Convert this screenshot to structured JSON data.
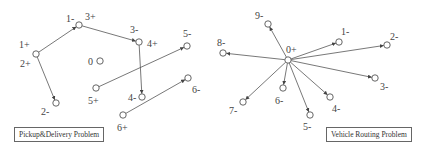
{
  "panels": [
    {
      "id": "pdp",
      "caption": "Pickup&Delivery Problem",
      "nodes": [
        {
          "id": "n1p",
          "x": 36,
          "y": 54,
          "labels": [
            {
              "text": "1+",
              "x": 19,
              "y": 48
            },
            {
              "text": "2+",
              "x": 20,
              "y": 67
            }
          ]
        },
        {
          "id": "n1m",
          "x": 79,
          "y": 25,
          "labels": [
            {
              "text": "1-",
              "x": 66,
              "y": 22
            },
            {
              "text": "3+",
              "x": 85,
              "y": 20
            }
          ]
        },
        {
          "id": "n3m",
          "x": 139,
          "y": 42,
          "labels": [
            {
              "text": "3-",
              "x": 130,
              "y": 33
            },
            {
              "text": "4+",
              "x": 147,
              "y": 47
            }
          ]
        },
        {
          "id": "n2m",
          "x": 56,
          "y": 103,
          "labels": [
            {
              "text": "2-",
              "x": 41,
              "y": 115
            }
          ]
        },
        {
          "id": "n0",
          "x": 100,
          "y": 61,
          "labels": [
            {
              "text": "0",
              "x": 88,
              "y": 65
            }
          ]
        },
        {
          "id": "n5p",
          "x": 96,
          "y": 88,
          "labels": [
            {
              "text": "5+",
              "x": 88,
              "y": 104
            }
          ]
        },
        {
          "id": "n5m",
          "x": 187,
          "y": 46,
          "labels": [
            {
              "text": "5-",
              "x": 183,
              "y": 37
            }
          ]
        },
        {
          "id": "n4m",
          "x": 142,
          "y": 97,
          "labels": [
            {
              "text": "4-",
              "x": 128,
              "y": 101
            }
          ]
        },
        {
          "id": "n6p",
          "x": 123,
          "y": 115,
          "labels": [
            {
              "text": "6+",
              "x": 117,
              "y": 131
            }
          ]
        },
        {
          "id": "n6m",
          "x": 188,
          "y": 78,
          "labels": [
            {
              "text": "6-",
              "x": 192,
              "y": 93
            }
          ]
        }
      ],
      "edges": [
        {
          "from": "n1p",
          "to": "n1m"
        },
        {
          "from": "n1m",
          "to": "n3m"
        },
        {
          "from": "n1p",
          "to": "n2m"
        },
        {
          "from": "n3m",
          "to": "n4m"
        },
        {
          "from": "n5p",
          "to": "n5m"
        },
        {
          "from": "n6p",
          "to": "n6m"
        }
      ]
    },
    {
      "id": "vrp",
      "caption": "Vehicle Routing Problem",
      "nodes": [
        {
          "id": "d0",
          "x": 288,
          "y": 60,
          "labels": [
            {
              "text": "0+",
              "x": 286,
              "y": 53
            }
          ]
        },
        {
          "id": "v1",
          "x": 339,
          "y": 42,
          "labels": [
            {
              "text": "1-",
              "x": 341,
              "y": 35
            }
          ]
        },
        {
          "id": "v2",
          "x": 387,
          "y": 45,
          "labels": [
            {
              "text": "2-",
              "x": 390,
              "y": 40
            }
          ]
        },
        {
          "id": "v3",
          "x": 375,
          "y": 78,
          "labels": [
            {
              "text": "3-",
              "x": 380,
              "y": 90
            }
          ]
        },
        {
          "id": "v4",
          "x": 330,
          "y": 97,
          "labels": [
            {
              "text": "4-",
              "x": 332,
              "y": 112
            }
          ]
        },
        {
          "id": "v5",
          "x": 310,
          "y": 115,
          "labels": [
            {
              "text": "5-",
              "x": 303,
              "y": 130
            }
          ]
        },
        {
          "id": "v6",
          "x": 283,
          "y": 88,
          "labels": [
            {
              "text": "6-",
              "x": 275,
              "y": 104
            }
          ]
        },
        {
          "id": "v7",
          "x": 243,
          "y": 102,
          "labels": [
            {
              "text": "7-",
              "x": 229,
              "y": 114
            }
          ]
        },
        {
          "id": "v8",
          "x": 223,
          "y": 53,
          "labels": [
            {
              "text": "8-",
              "x": 217,
              "y": 46
            }
          ]
        },
        {
          "id": "v9",
          "x": 268,
          "y": 24,
          "labels": [
            {
              "text": "9-",
              "x": 255,
              "y": 19
            }
          ]
        }
      ],
      "edges": [
        {
          "from": "d0",
          "to": "v1"
        },
        {
          "from": "d0",
          "to": "v2"
        },
        {
          "from": "d0",
          "to": "v3"
        },
        {
          "from": "d0",
          "to": "v4"
        },
        {
          "from": "d0",
          "to": "v5"
        },
        {
          "from": "d0",
          "to": "v6"
        },
        {
          "from": "d0",
          "to": "v7"
        },
        {
          "from": "d0",
          "to": "v8"
        },
        {
          "from": "d0",
          "to": "v9"
        }
      ]
    }
  ],
  "captions": {
    "pdp": "Pickup&Delivery Problem",
    "vrp": "Vehicle Routing Problem"
  }
}
